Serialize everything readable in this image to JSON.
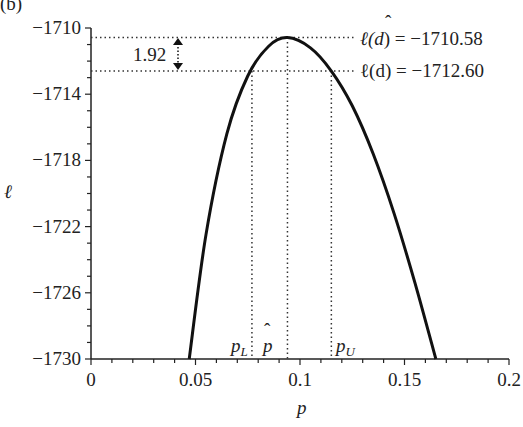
{
  "panel_label": "(b)",
  "chart_data": {
    "type": "line",
    "title": "",
    "xlabel": "p",
    "ylabel": "ℓ",
    "xlim": [
      0,
      0.2
    ],
    "ylim": [
      -1730,
      -1710
    ],
    "x_ticks": [
      0,
      0.05,
      0.1,
      0.15,
      0.2
    ],
    "x_tick_labels": [
      "0",
      "0.05",
      "0.1",
      "0.15",
      "0.2"
    ],
    "y_ticks": [
      -1710,
      -1714,
      -1718,
      -1722,
      -1726,
      -1730
    ],
    "y_tick_labels": [
      "−1710",
      "−1714",
      "−1718",
      "−1722",
      "−1726",
      "−1730"
    ],
    "grid": false,
    "legend": "none",
    "series": [
      {
        "name": "log-likelihood ℓ(p)",
        "x": [
          0.047,
          0.055,
          0.065,
          0.075,
          0.085,
          0.094,
          0.105,
          0.115,
          0.125,
          0.135,
          0.145,
          0.155,
          0.165
        ],
        "y": [
          -1730,
          -1722.5,
          -1716.4,
          -1712.9,
          -1711.1,
          -1710.58,
          -1711.2,
          -1712.6,
          -1714.7,
          -1717.6,
          -1721.2,
          -1725.4,
          -1730
        ]
      }
    ],
    "annotations": {
      "max_line": {
        "label": "ℓ(d̂) = −1710.58",
        "y": -1710.58
      },
      "cut_line": {
        "label": "ℓ(d) = −1712.60",
        "y": -1712.6
      },
      "difference": {
        "label": "1.92",
        "from": -1710.58,
        "to": -1712.6
      },
      "p_L": {
        "label": "p_L",
        "x": 0.077
      },
      "p_hat": {
        "label": "p̂",
        "x": 0.094
      },
      "p_U": {
        "label": "p_U",
        "x": 0.115
      }
    }
  },
  "labels": {
    "max_line_lhs": "ℓ(",
    "max_line_d": "d",
    "max_line_rhs": ") = −1710.58",
    "cut_line": "ℓ(d) = −1712.60",
    "diff": "1.92",
    "pL": "p",
    "pL_sub": "L",
    "phat": "p",
    "pU": "p",
    "pU_sub": "U",
    "xlabel": "p",
    "ylabel": "ℓ"
  }
}
